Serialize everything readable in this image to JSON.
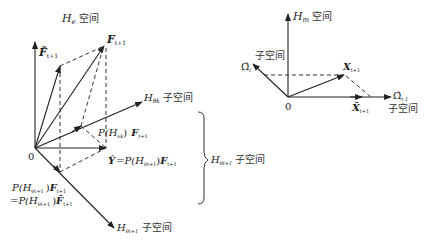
{
  "left_diagram": {
    "title": {
      "symbol": "H",
      "sub": "e",
      "text": "空间"
    },
    "origin_label": "0",
    "f_tilde": {
      "symbol": "F̃",
      "sub": "t+1"
    },
    "f": {
      "symbol": "F",
      "sub": "t+1"
    },
    "h_theta_k": {
      "symbol": "H",
      "sub": "θk",
      "text": "子空间"
    },
    "projection_k": {
      "prefix": "P(H",
      "sub": "ek",
      "mid": ")",
      "vec": "F",
      "vec_sub": "t+1"
    },
    "y_label": {
      "lhs": "Ŷ",
      "eq": "=P(H",
      "sub": "θt+1",
      "mid": ")",
      "vec": "F",
      "vec_sub": "t+1"
    },
    "projection_t1_line1": {
      "prefix": "P(H",
      "sub": "θt+1",
      "mid": ")",
      "vec": "F",
      "vec_sub": "t+1"
    },
    "projection_t1_line2": {
      "prefix": "=P(H",
      "sub": "θt+1",
      "mid": ")",
      "vec": "F̃",
      "vec_sub": "t+1"
    },
    "h_theta_t1_axis": {
      "symbol": "H",
      "sub": "θt+1",
      "text": "子空间"
    }
  },
  "brace_label": {
    "symbol": "H",
    "sub": "θt+1",
    "text": "子空间"
  },
  "right_diagram": {
    "title": {
      "symbol": "H",
      "sub": "m",
      "text": "空间"
    },
    "origin_label": "0",
    "omega_t": {
      "symbol": "Ω̂",
      "sub": "t",
      "text": "子空间"
    },
    "x": {
      "symbol": "X",
      "sub": "t+1"
    },
    "x_tilde": {
      "symbol": "X̃",
      "sub": "t+1"
    },
    "omega_t1": {
      "symbol": "Ω̂",
      "sub": "t-1",
      "text": "子空间"
    }
  },
  "colors": {
    "line": "#222222",
    "dash": "#333333",
    "background": "#ffffff"
  }
}
